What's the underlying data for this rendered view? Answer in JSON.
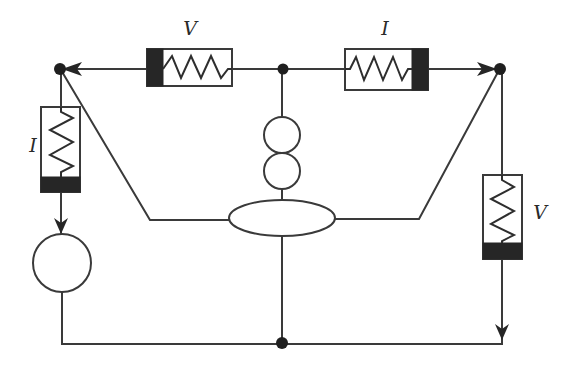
{
  "diagram": {
    "type": "bond-graph-like circuit schematic",
    "labels": {
      "top_left_element": "V",
      "top_right_element": "I",
      "left_element": "I",
      "right_element": "V"
    },
    "nodes": [
      {
        "id": "top-left",
        "x": 60,
        "y": 69
      },
      {
        "id": "top-center",
        "x": 283,
        "y": 69
      },
      {
        "id": "top-right",
        "x": 500,
        "y": 69
      },
      {
        "id": "bottom-center",
        "x": 282,
        "y": 343
      }
    ],
    "elements": [
      {
        "id": "resistor-top-left",
        "label": "V",
        "orientation": "horizontal",
        "dark_end": "left"
      },
      {
        "id": "resistor-top-right",
        "label": "I",
        "orientation": "horizontal",
        "dark_end": "right"
      },
      {
        "id": "resistor-left",
        "label": "I",
        "orientation": "vertical",
        "dark_end": "bottom"
      },
      {
        "id": "resistor-right",
        "label": "V",
        "orientation": "vertical",
        "dark_end": "bottom"
      },
      {
        "id": "source-circle-left",
        "shape": "circle"
      },
      {
        "id": "double-circle-center",
        "shape": "two stacked circles"
      },
      {
        "id": "ellipse-center",
        "shape": "ellipse"
      }
    ],
    "colors": {
      "line": "#3a3a3a",
      "fill_dark": "#262626",
      "background": "#ffffff"
    }
  }
}
